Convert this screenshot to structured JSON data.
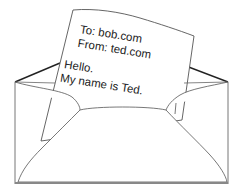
{
  "illustration": {
    "subject": "open envelope with letter",
    "colors": {
      "background": "#ffffff",
      "line": "#555555",
      "dark_line": "#222222",
      "text": "#222222"
    },
    "letter": {
      "to_line": "To: bob.com",
      "from_line": "From: ted.com",
      "greeting": "Hello.",
      "body": "My name is Ted."
    }
  }
}
